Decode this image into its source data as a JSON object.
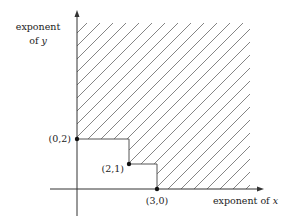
{
  "diagram": {
    "y_axis_label_line1": "exponent",
    "y_axis_label_line2_prefix": "of ",
    "y_axis_label_var": "y",
    "x_axis_label_prefix": "exponent of ",
    "x_axis_label_var": "x",
    "points": [
      {
        "label": "(0,2)",
        "x": 0,
        "y": 2
      },
      {
        "label": "(2,1)",
        "x": 2,
        "y": 1
      },
      {
        "label": "(3,0)",
        "x": 3,
        "y": 0
      }
    ],
    "region": "hatched staircase region above/right of monomials",
    "colors": {
      "axis": "#333333",
      "hatch": "#777777",
      "boundary": "#555555",
      "point": "#111111"
    }
  }
}
